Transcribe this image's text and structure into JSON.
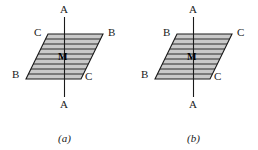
{
  "figure": {
    "type": "two-panel-diagram",
    "background_color": "#ffffff",
    "plane_fill_color": "#c9c9c9",
    "plane_edge_color": "#1a1a1a",
    "hatch_line_color": "#1a1a1a",
    "axis_line_color": "#1a1a1a",
    "text_color": "#1a1a1a"
  },
  "panels": [
    {
      "id": "a",
      "caption": "(a)",
      "axis_top_label": "A",
      "axis_bottom_label": "A",
      "center_label": "M",
      "corner_labels": {
        "top_left": "C",
        "top_right": "B",
        "bottom_left": "B",
        "bottom_right": "C"
      },
      "hatch_line_count": 8
    },
    {
      "id": "b",
      "caption": "(b)",
      "axis_top_label": "A",
      "axis_bottom_label": "A",
      "center_label": "M",
      "corner_labels": {
        "top_left": "B",
        "top_right": "C",
        "bottom_left": "B",
        "bottom_right": "C"
      },
      "hatch_line_count": 8
    }
  ]
}
